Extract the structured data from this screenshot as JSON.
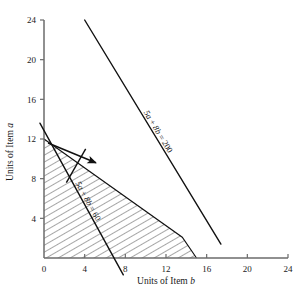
{
  "chart_data": {
    "type": "line",
    "title": "",
    "xlabel": "Units of Item b",
    "ylabel": "Units of Item a",
    "xlim": [
      0,
      24
    ],
    "ylim": [
      0,
      24
    ],
    "xticks": [
      0,
      4,
      8,
      12,
      16,
      20,
      24
    ],
    "yticks": [
      0,
      4,
      8,
      12,
      16,
      20,
      24
    ],
    "xtick_labels": [
      "0",
      "4",
      "8",
      "12",
      "16",
      "20",
      "24"
    ],
    "ytick_labels": [
      "0",
      "4",
      "8",
      "12",
      "16",
      "20",
      "24"
    ],
    "grid": false,
    "legend": "none",
    "series": [
      {
        "name": "5a + 8b = 200",
        "label": "5a + 8b = 200",
        "type": "line",
        "x": [
          4.0,
          17.4
        ],
        "y": [
          24.0,
          1.4
        ],
        "label_x": 11.0,
        "label_y": 12.6
      },
      {
        "name": "5a + 8b = 60",
        "label": "5a + 8b = 60",
        "type": "line",
        "x": [
          -0.4,
          7.8
        ],
        "y": [
          13.6,
          -1.7
        ],
        "label_x": 4.1,
        "label_y": 5.6
      },
      {
        "name": "feasible-region-upper-boundary",
        "label": "",
        "type": "area",
        "x": [
          0.0,
          13.6,
          14.6,
          15.0
        ],
        "y": [
          12.0,
          2.1,
          0.6,
          0.0
        ],
        "hatched": true
      }
    ],
    "annotations": [
      {
        "name": "gradient-arrow",
        "type": "arrow",
        "x_start": 0.4,
        "y_start": 11.6,
        "x_end": 5.1,
        "y_end": 9.6
      },
      {
        "name": "gradient-arrow-cross-tick",
        "type": "segment",
        "x_start": 2.2,
        "y_start": 7.6,
        "x_end": 4.1,
        "y_end": 11.0
      }
    ],
    "axis_labels": {
      "x_prefix": "Units of Item ",
      "x_italic": "b",
      "y_prefix": "Units of Item ",
      "y_italic": "a"
    },
    "line_label_parts": {
      "upper": {
        "coef_a": "5a",
        "plus": " + ",
        "coef_b": "8b",
        "eq": " = ",
        "rhs": "200"
      },
      "lower": {
        "coef_a": "5a",
        "plus": " + ",
        "coef_b": "8b",
        "eq": " = ",
        "rhs": "60"
      }
    },
    "colors": {
      "axis": "#6b6b6b",
      "line": "#111111",
      "hatch": "#3a3a3a",
      "text": "#1a1a1a",
      "background": "#ffffff"
    }
  },
  "footer": {
    "caption_fragment": ""
  }
}
